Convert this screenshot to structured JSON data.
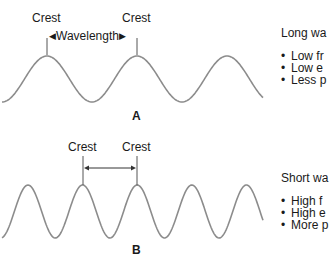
{
  "panel_a": {
    "letter": "A",
    "crest_left_label": "Crest",
    "crest_right_label": "Crest",
    "wavelength_label": "Wavelength",
    "description_title": "Long wa",
    "bullets": [
      "Low fr",
      "Low e",
      "Less p"
    ]
  },
  "panel_b": {
    "letter": "B",
    "crest_left_label": "Crest",
    "crest_right_label": "Crest",
    "description_title": "Short wa",
    "bullets": [
      "High f",
      "High e",
      "More p"
    ]
  },
  "colors": {
    "wave": "#8c8c8c",
    "marker": "#555555",
    "text": "#1a1a1a"
  }
}
